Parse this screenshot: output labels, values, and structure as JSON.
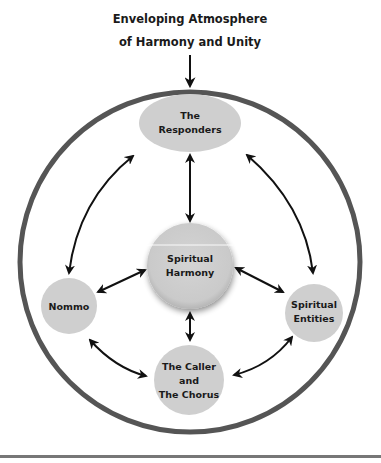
{
  "title": {
    "line1": "Enveloping Atmosphere",
    "line2": "of Harmony and Unity"
  },
  "nodes": {
    "responders": {
      "line1": "The",
      "line2": "Responders",
      "shape": "ellipse"
    },
    "center": {
      "line1": "Spiritual",
      "line2": "Harmony",
      "shape": "circle"
    },
    "nommo": {
      "line1": "Nommo",
      "shape": "circle"
    },
    "entities": {
      "line1": "Spiritual",
      "line2": "Entities",
      "shape": "circle"
    },
    "caller": {
      "line1": "The Caller",
      "line2": "and",
      "line3": "The Chorus",
      "shape": "circle"
    }
  },
  "connections": [
    {
      "from": "title",
      "to": "outer-circle",
      "type": "one-way"
    },
    {
      "from": "responders",
      "to": "center",
      "type": "two-way"
    },
    {
      "from": "center",
      "to": "caller",
      "type": "two-way"
    },
    {
      "from": "center",
      "to": "nommo",
      "type": "two-way"
    },
    {
      "from": "center",
      "to": "entities",
      "type": "two-way"
    },
    {
      "from": "responders",
      "to": "nommo",
      "type": "two-way-curved"
    },
    {
      "from": "responders",
      "to": "entities",
      "type": "two-way-curved"
    },
    {
      "from": "nommo",
      "to": "caller",
      "type": "two-way-curved"
    },
    {
      "from": "entities",
      "to": "caller",
      "type": "two-way-curved"
    }
  ],
  "colors": {
    "node_fill": "#cfcfcf",
    "outer_ring": "#555555",
    "arrow": "#111111",
    "text": "#1a1a1a",
    "rule": "#777777"
  }
}
